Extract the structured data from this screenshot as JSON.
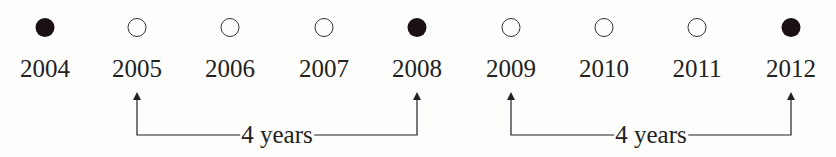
{
  "timeline": {
    "years": [
      {
        "label": "2004",
        "filled": true,
        "x": 45
      },
      {
        "label": "2005",
        "filled": false,
        "x": 137
      },
      {
        "label": "2006",
        "filled": false,
        "x": 230
      },
      {
        "label": "2007",
        "filled": false,
        "x": 324
      },
      {
        "label": "2008",
        "filled": true,
        "x": 417
      },
      {
        "label": "2009",
        "filled": false,
        "x": 511
      },
      {
        "label": "2010",
        "filled": false,
        "x": 604
      },
      {
        "label": "2011",
        "filled": false,
        "x": 697
      },
      {
        "label": "2012",
        "filled": true,
        "x": 791
      }
    ],
    "spans": [
      {
        "from": "2005",
        "to": "2008",
        "label": "4 years",
        "x1": 137,
        "x2": 417
      },
      {
        "from": "2009",
        "to": "2012",
        "label": "4 years",
        "x1": 511,
        "x2": 791
      }
    ]
  },
  "colors": {
    "ink": "#222222",
    "filled_dot": "#1a1212",
    "background": "#fdfdfb"
  }
}
